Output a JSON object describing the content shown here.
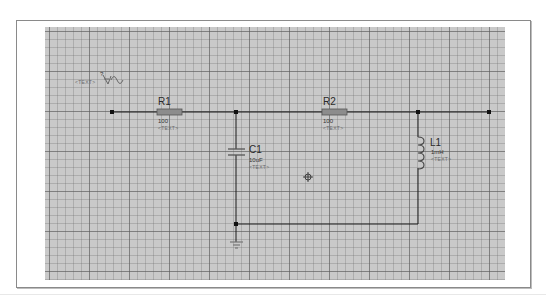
{
  "canvas": {
    "background": "#c9c9c9",
    "grid_minor_px": 8,
    "grid_major_px": 40
  },
  "wire_color": "#1a1a1a",
  "components": {
    "source": {
      "ref_hidden": true,
      "text": "<TEXT>",
      "question": "?",
      "symbol": "AC source"
    },
    "r1": {
      "ref": "R1",
      "value": "100",
      "text": "<TEXT>"
    },
    "r2": {
      "ref": "R2",
      "value": "100",
      "text": "<TEXT>"
    },
    "c1": {
      "ref": "C1",
      "value": "10uF",
      "text": "<TEXT>"
    },
    "l1": {
      "ref": "L1",
      "value": "1mH",
      "text": "<TEXT>"
    }
  },
  "markers": {
    "cursor": "crosshair-circle"
  }
}
